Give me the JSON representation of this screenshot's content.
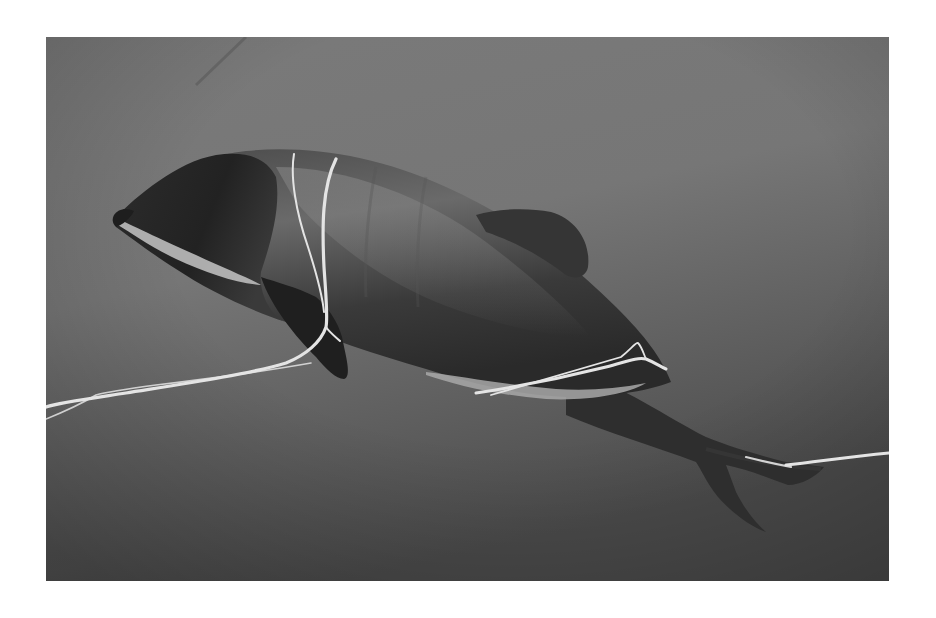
{
  "image": {
    "alt": "Black-and-white underwater photograph of a small dolphin entangled in white rope",
    "subject": "dolphin",
    "scene": "underwater",
    "color_mode": "grayscale",
    "elements": [
      "dolphin-body",
      "dorsal-fin",
      "pectoral-fin",
      "tail-flukes",
      "rope"
    ],
    "colors": {
      "page_border": "#ffffff",
      "water_light": "#8a8a8a",
      "water_mid": "#6e6e6e",
      "water_dark": "#4a4a4a",
      "dolphin_dark": "#262626",
      "dolphin_mid": "#5a5a5a",
      "dolphin_belly": "#b8b8b8",
      "rope": "#e6e6e6"
    }
  }
}
